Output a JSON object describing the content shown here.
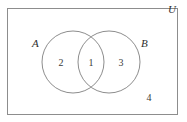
{
  "figure": {
    "type": "venn-diagram",
    "sets": 2,
    "stroke_color": "#8a8a8a",
    "text_color": "#3a3a3a",
    "background_color": "#ffffff"
  },
  "universe": {
    "label": "U",
    "outside_count": "4"
  },
  "sets": [
    {
      "id": "A",
      "label": "A",
      "only_count": "2"
    },
    {
      "id": "B",
      "label": "B",
      "only_count": "3"
    }
  ],
  "intersection": {
    "label": "A ∩ B",
    "count": "1"
  },
  "regions": [
    {
      "name": "A-only",
      "value": "2"
    },
    {
      "name": "A-intersect-B",
      "value": "1"
    },
    {
      "name": "B-only",
      "value": "3"
    },
    {
      "name": "outside-both",
      "value": "4"
    }
  ]
}
